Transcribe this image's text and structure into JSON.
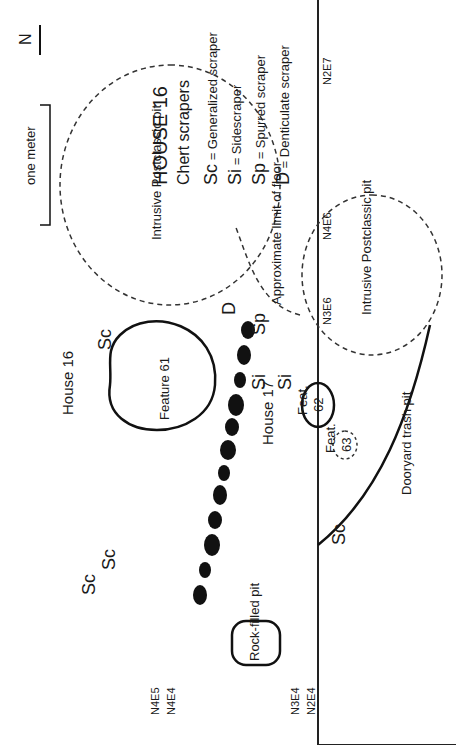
{
  "title": "HOUSE 16",
  "subtitle": "Chert scrapers",
  "legend": [
    {
      "code": "Sc",
      "meaning": "Generalized scraper"
    },
    {
      "code": "Si",
      "meaning": "Sidescraper"
    },
    {
      "code": "Sp",
      "meaning": "Spurred scraper"
    },
    {
      "code": "D",
      "meaning": "Denticulate scraper"
    }
  ],
  "north_arrow": "N",
  "scale_label": "one meter",
  "grid_labels": {
    "n4e6": "N4E6",
    "n3e6": "N3E6",
    "n2e7": "N2E7",
    "n4e5": "N4E5",
    "n4e4": "N4E4",
    "n3e4": "N3E4",
    "n2e4": "N2E4"
  },
  "features": {
    "pit_upper": "Intrusive Postclassic pit",
    "pit_lower": "Intrusive Postclassic pit",
    "floor_limit": "Approximate limit of floor",
    "feature_61": "Feature 61",
    "feature_62_label": "Feat.",
    "feature_62_num": "62",
    "feature_63_label": "Feat.",
    "feature_63_num": "63",
    "rock_filled_pit": "Rock-filled pit",
    "dooryard": "Dooryard trash pit"
  },
  "houses": {
    "house_16": "House 16",
    "house_17": "House 17"
  },
  "markers": {
    "sc": "Sc",
    "si": "Si",
    "sp": "Sp",
    "d": "D"
  }
}
